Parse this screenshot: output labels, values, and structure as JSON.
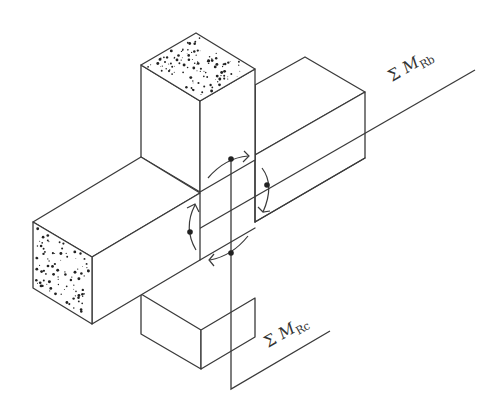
{
  "diagram": {
    "type": "isometric beam-column joint",
    "labels": {
      "beam_moment": {
        "sigma": "Σ",
        "symbol": "M",
        "subscript": "Rb"
      },
      "column_moment": {
        "sigma": "Σ",
        "symbol": "M",
        "subscript": "Rc"
      }
    },
    "elements": [
      {
        "id": "column-top",
        "label": "Column (upper)"
      },
      {
        "id": "column-bottom",
        "label": "Column (lower)"
      },
      {
        "id": "beam-left",
        "label": "Beam (left, front end)"
      },
      {
        "id": "beam-right",
        "label": "Beam (right, back end)"
      },
      {
        "id": "moment-arrows",
        "label": "Moment arrows around joint",
        "count": 4
      }
    ],
    "colors": {
      "line": "#3a3a3a",
      "background": "#ffffff",
      "concrete_speckle": "#222222"
    }
  }
}
